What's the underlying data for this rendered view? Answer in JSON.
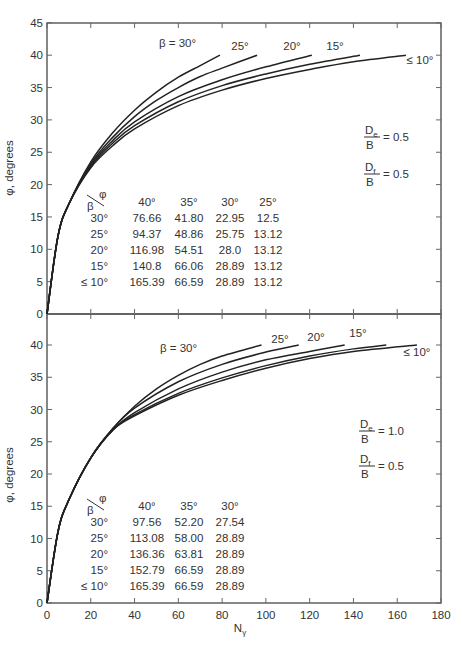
{
  "chart_data": [
    {
      "type": "line",
      "title": "",
      "xlabel": "Nγ",
      "ylabel": "φ, degrees",
      "xlim": [
        0,
        180
      ],
      "ylim": [
        0,
        45
      ],
      "yticks": [
        0,
        5,
        10,
        15,
        20,
        25,
        30,
        35,
        40,
        45
      ],
      "xticks": [
        0,
        20,
        40,
        60,
        80,
        100,
        120,
        140,
        160,
        180
      ],
      "grid": false,
      "annotations": {
        "de_over_b": "De/B = 0.5",
        "df_over_b": "Df/B = 0.5"
      },
      "series": [
        {
          "name": "β = 30°",
          "label": "β = 30°",
          "end_x": 79,
          "points": [
            [
              0,
              0
            ],
            [
              5,
              12
            ],
            [
              10,
              17
            ],
            [
              20,
              23.5
            ],
            [
              30,
              28
            ],
            [
              40,
              31.5
            ],
            [
              50,
              34.3
            ],
            [
              60,
              36.6
            ],
            [
              70,
              38.4
            ],
            [
              79,
              40
            ]
          ]
        },
        {
          "name": "β = 25°",
          "label": "25°",
          "end_x": 96,
          "points": [
            [
              0,
              0
            ],
            [
              5,
              12
            ],
            [
              10,
              17
            ],
            [
              20,
              23.2
            ],
            [
              30,
              27.3
            ],
            [
              40,
              30.5
            ],
            [
              50,
              33
            ],
            [
              60,
              35
            ],
            [
              70,
              36.7
            ],
            [
              80,
              38
            ],
            [
              96,
              40
            ]
          ]
        },
        {
          "name": "β = 20°",
          "label": "20°",
          "end_x": 121,
          "points": [
            [
              0,
              0
            ],
            [
              5,
              12
            ],
            [
              10,
              17
            ],
            [
              20,
              23
            ],
            [
              30,
              26.8
            ],
            [
              40,
              29.7
            ],
            [
              60,
              33.6
            ],
            [
              80,
              36.2
            ],
            [
              100,
              38.2
            ],
            [
              121,
              40
            ]
          ]
        },
        {
          "name": "β = 15°",
          "label": "15°",
          "end_x": 143,
          "points": [
            [
              0,
              0
            ],
            [
              5,
              12
            ],
            [
              10,
              17
            ],
            [
              20,
              22.8
            ],
            [
              30,
              26.4
            ],
            [
              40,
              29.1
            ],
            [
              60,
              32.8
            ],
            [
              80,
              35.3
            ],
            [
              100,
              37.1
            ],
            [
              120,
              38.6
            ],
            [
              143,
              40
            ]
          ]
        },
        {
          "name": "β ≤ 10°",
          "label": "≤ 10°",
          "end_x": 164,
          "points": [
            [
              0,
              0
            ],
            [
              5,
              12
            ],
            [
              10,
              17
            ],
            [
              20,
              22.6
            ],
            [
              30,
              26
            ],
            [
              40,
              28.6
            ],
            [
              60,
              32.2
            ],
            [
              80,
              34.6
            ],
            [
              100,
              36.4
            ],
            [
              120,
              37.8
            ],
            [
              140,
              39
            ],
            [
              164,
              40
            ]
          ]
        }
      ],
      "table": {
        "header_corner": {
          "top": "φ",
          "bottom": "β"
        },
        "columns": [
          "40°",
          "35°",
          "30°",
          "25°"
        ],
        "rows": [
          {
            "beta": "30°",
            "values": [
              "76.66",
              "41.80",
              "22.95",
              "12.5"
            ]
          },
          {
            "beta": "25°",
            "values": [
              "94.37",
              "48.86",
              "25.75",
              "13.12"
            ]
          },
          {
            "beta": "20°",
            "values": [
              "116.98",
              "54.51",
              "28.0",
              "13.12"
            ]
          },
          {
            "beta": "15°",
            "values": [
              "140.8",
              "66.06",
              "28.89",
              "13.12"
            ]
          },
          {
            "beta": "≤ 10°",
            "values": [
              "165.39",
              "66.59",
              "28.89",
              "13.12"
            ]
          }
        ]
      }
    },
    {
      "type": "line",
      "title": "",
      "xlabel": "Nγ",
      "ylabel": "φ, degrees",
      "xlim": [
        0,
        180
      ],
      "ylim": [
        0,
        45
      ],
      "yticks": [
        0,
        5,
        10,
        15,
        20,
        25,
        30,
        35,
        40
      ],
      "xticks": [
        0,
        20,
        40,
        60,
        80,
        100,
        120,
        140,
        160,
        180
      ],
      "grid": false,
      "annotations": {
        "de_over_b": "De/B = 1.0",
        "df_over_b": "Df/B = 0.5"
      },
      "series": [
        {
          "name": "β = 30°",
          "label": "β = 30°",
          "end_x": 98,
          "points": [
            [
              0,
              0
            ],
            [
              5,
              11
            ],
            [
              10,
              16
            ],
            [
              20,
              22.5
            ],
            [
              30,
              27
            ],
            [
              40,
              30.5
            ],
            [
              50,
              33.2
            ],
            [
              60,
              35.3
            ],
            [
              70,
              37
            ],
            [
              80,
              38.3
            ],
            [
              98,
              40
            ]
          ]
        },
        {
          "name": "β = 25°",
          "label": "25°",
          "end_x": 115,
          "points": [
            [
              0,
              0
            ],
            [
              5,
              11
            ],
            [
              10,
              16
            ],
            [
              20,
              22.5
            ],
            [
              30,
              27
            ],
            [
              40,
              30.2
            ],
            [
              60,
              34.3
            ],
            [
              80,
              37
            ],
            [
              100,
              38.9
            ],
            [
              115,
              40
            ]
          ]
        },
        {
          "name": "β = 20°",
          "label": "20°",
          "end_x": 136,
          "points": [
            [
              0,
              0
            ],
            [
              5,
              11
            ],
            [
              10,
              16
            ],
            [
              20,
              22.5
            ],
            [
              30,
              26.8
            ],
            [
              40,
              29.5
            ],
            [
              60,
              33.2
            ],
            [
              80,
              35.8
            ],
            [
              100,
              37.7
            ],
            [
              120,
              39
            ],
            [
              136,
              40
            ]
          ]
        },
        {
          "name": "β = 15°",
          "label": "15°",
          "end_x": 155,
          "points": [
            [
              0,
              0
            ],
            [
              5,
              11
            ],
            [
              10,
              16
            ],
            [
              20,
              22.5
            ],
            [
              30,
              26.8
            ],
            [
              40,
              29.2
            ],
            [
              60,
              32.5
            ],
            [
              80,
              34.9
            ],
            [
              100,
              36.8
            ],
            [
              120,
              38.3
            ],
            [
              140,
              39.4
            ],
            [
              155,
              40
            ]
          ]
        },
        {
          "name": "β ≤ 10°",
          "label": "≤ 10°",
          "end_x": 169,
          "points": [
            [
              0,
              0
            ],
            [
              5,
              11
            ],
            [
              10,
              16
            ],
            [
              20,
              22.5
            ],
            [
              30,
              26.8
            ],
            [
              40,
              29
            ],
            [
              60,
              32.2
            ],
            [
              80,
              34.5
            ],
            [
              100,
              36.4
            ],
            [
              120,
              37.9
            ],
            [
              140,
              39
            ],
            [
              169,
              40
            ]
          ]
        }
      ],
      "table": {
        "header_corner": {
          "top": "φ",
          "bottom": "β"
        },
        "columns": [
          "40°",
          "35°",
          "30°"
        ],
        "rows": [
          {
            "beta": "30°",
            "values": [
              "97.56",
              "52.20",
              "27.54"
            ]
          },
          {
            "beta": "25°",
            "values": [
              "113.08",
              "58.00",
              "28.89"
            ]
          },
          {
            "beta": "20°",
            "values": [
              "136.36",
              "63.81",
              "28.89"
            ]
          },
          {
            "beta": "15°",
            "values": [
              "152.79",
              "66.59",
              "28.89"
            ]
          },
          {
            "beta": "≤ 10°",
            "values": [
              "165.39",
              "66.59",
              "28.89"
            ]
          }
        ]
      }
    }
  ],
  "labels": {
    "ylabel": "φ, degrees",
    "xlabel_main": "N",
    "xlabel_sub": "γ",
    "top_de": {
      "num": "D",
      "num_sub": "e",
      "den": "B",
      "val": "= 0.5"
    },
    "top_df": {
      "num": "D",
      "num_sub": "f",
      "den": "B",
      "val": "= 0.5"
    },
    "bot_de": {
      "num": "D",
      "num_sub": "e",
      "den": "B",
      "val": "= 1.0"
    },
    "bot_df": {
      "num": "D",
      "num_sub": "f",
      "den": "B",
      "val": "= 0.5"
    }
  }
}
